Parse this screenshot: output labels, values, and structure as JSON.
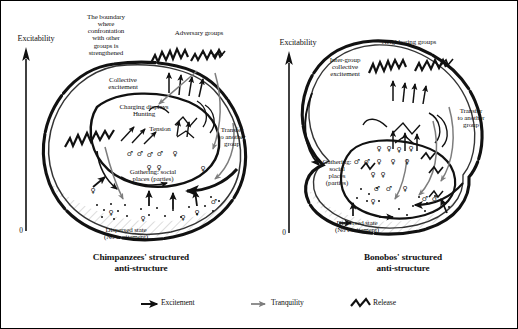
{
  "figure": {
    "axis": {
      "label": "Excitability",
      "zero": "0"
    },
    "panels": [
      {
        "id": "chimpanzees",
        "caption": "Chimpanzees' structured\nanti-structure",
        "labels": {
          "boundary": "The boundary\nwhere\nconfrontation\nwith other\ngroups is\nstrengthened",
          "adversary_groups": "Adversary groups",
          "collective_excitement": "Collective\nexcitement",
          "charging_displays": "Charging displays\nHunting",
          "tension": "Tension",
          "transfer": "Transfer\nto another\ngroup",
          "gathering": "Gathering: social\nplaces (parties)",
          "dispersed": "Dispersed state\n(No excitement)"
        }
      },
      {
        "id": "bonobos",
        "caption": "Bonobos' structured\nanti-structure",
        "labels": {
          "neighboring_groups": "Neighboring groups",
          "inter_group": "Inter-group\ncollective\nexcitement",
          "transfer": "Transfer\nto another\ngroup",
          "gathering": "Gathering:\nsocial\nplaces\n(parties)",
          "dispersed": "Dispersed state\n(No excitement)"
        }
      }
    ],
    "legend": {
      "items": [
        {
          "icon": "black-arrow-icon",
          "label": "Excitement",
          "color": "#111111"
        },
        {
          "icon": "gray-arrow-icon",
          "label": "Tranquility",
          "color": "#7d7d7d"
        },
        {
          "icon": "zigzag-release-icon",
          "label": "Release",
          "color": "#111111"
        }
      ]
    },
    "colors": {
      "ink": "#111111",
      "tranquility": "#7d7d7d",
      "hatch": "#9a9a9a",
      "background": "#ffffff",
      "border": "#000000"
    }
  }
}
